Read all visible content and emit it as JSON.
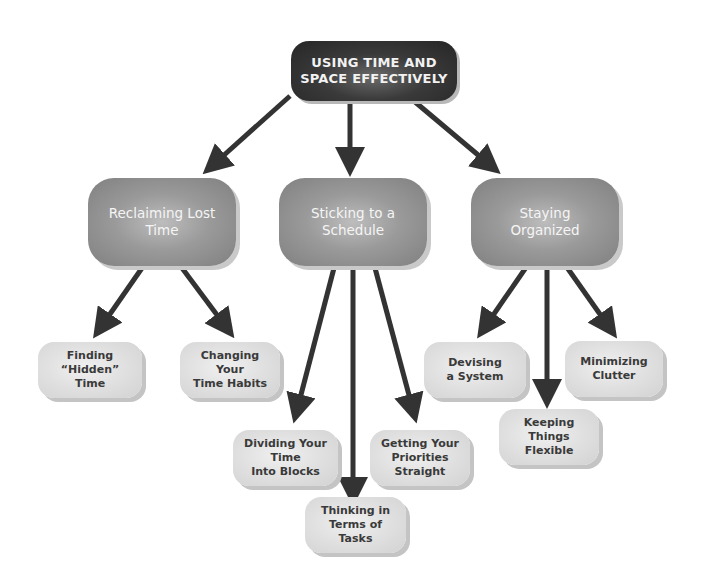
{
  "root": {
    "line1": "USING TIME AND",
    "line2": "SPACE EFFECTIVELY"
  },
  "branches": [
    {
      "line1": "Reclaiming Lost",
      "line2": "Time",
      "children": [
        {
          "line1": "Finding “Hidden”",
          "line2": "Time"
        },
        {
          "line1": "Changing Your",
          "line2": "Time Habits"
        }
      ]
    },
    {
      "line1": "Sticking to a",
      "line2": "Schedule",
      "children": [
        {
          "line1": "Dividing Your Time",
          "line2": "Into Blocks"
        },
        {
          "line1": "Thinking in",
          "line2": "Terms of Tasks"
        },
        {
          "line1": "Getting Your",
          "line2": "Priorities Straight"
        }
      ]
    },
    {
      "line1": "Staying",
      "line2": "Organized",
      "children": [
        {
          "line1": "Devising",
          "line2": "a System"
        },
        {
          "line1": "Keeping Things",
          "line2": "Flexible"
        },
        {
          "line1": "Minimizing",
          "line2": "Clutter"
        }
      ]
    }
  ],
  "colors": {
    "root_fill": "#2e2e2e",
    "branch_fill": "#9a9a9a",
    "leaf_fill": "#e0e0e0",
    "arrow": "#333333"
  }
}
